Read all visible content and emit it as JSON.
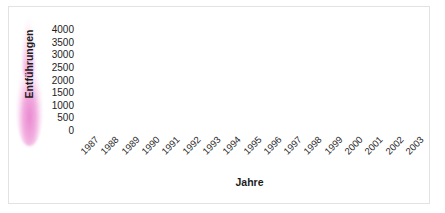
{
  "chart_data": {
    "type": "line",
    "title": "",
    "xlabel": "Jahre",
    "ylabel": "Entführungen",
    "categories": [
      "1987",
      "1988",
      "1989",
      "1990",
      "1991",
      "1992",
      "1993",
      "1994",
      "1995",
      "1996",
      "1997",
      "1998",
      "1999",
      "2000",
      "2001",
      "2002",
      "2003"
    ],
    "values": [
      230,
      630,
      710,
      1170,
      1400,
      1300,
      1010,
      1280,
      1140,
      1600,
      2000,
      2370,
      3300,
      3700,
      3050,
      3010,
      2210
    ],
    "series": [
      {
        "name": "Entführungen",
        "values": [
          230,
          630,
          710,
          1170,
          1400,
          1300,
          1010,
          1280,
          1140,
          1600,
          2000,
          2370,
          3300,
          3700,
          3050,
          3010,
          2210
        ]
      }
    ],
    "ylim": [
      0,
      4000
    ],
    "yticks": [
      0,
      500,
      1000,
      1500,
      2000,
      2500,
      3000,
      3500,
      4000
    ],
    "ytick_labels": [
      "0",
      "500",
      "1000",
      "1500",
      "2000",
      "2500",
      "3000",
      "3500",
      "4000"
    ],
    "xtick_labels": [
      "1987",
      "1988",
      "1989",
      "1990",
      "1991",
      "1992",
      "1993",
      "1994",
      "1995",
      "1996",
      "1997",
      "1998",
      "1999",
      "2000",
      "2001",
      "2002",
      "2003"
    ],
    "grid": true,
    "grid_axis": "y",
    "legend": false,
    "legend_position": "none",
    "marker": "diamond",
    "line_color": "#1a1a1a",
    "marker_color": "#111111",
    "grid_color": "#e8e8e8",
    "axis_color": "#b9b9b9",
    "background_color": "#ffffff",
    "accent_color": "#e982cd",
    "xtick_rotation": -45
  },
  "figure": {
    "border_color": "#e2e2e2",
    "ylabel_highlight_color": "#e982cd"
  }
}
